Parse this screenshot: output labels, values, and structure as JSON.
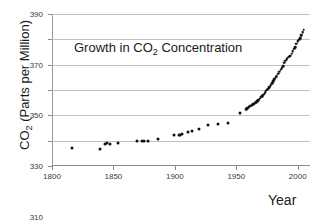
{
  "chart_data": {
    "type": "scatter",
    "title": "Growth in CO2 Concentration",
    "title_prefix": "Growth in CO",
    "title_sub": "2",
    "title_suffix": " Concentration",
    "xlabel": "Year",
    "ylabel": "CO2 (Parts per Million)",
    "ylabel_prefix": "CO",
    "ylabel_sub": "2",
    "ylabel_suffix": " (Parts per Million)",
    "xlim": [
      1800,
      2010
    ],
    "ylim": [
      270,
      390
    ],
    "xticks": [
      1800,
      1850,
      1900,
      1950,
      2000
    ],
    "yticks": [
      270,
      290,
      310,
      330,
      350,
      370,
      390
    ],
    "grid": "horizontal",
    "legend": "none",
    "series": [
      {
        "name": "Ice core records",
        "marker": "filled-circle",
        "color": "#101010",
        "points": [
          [
            1816,
            284.3
          ],
          [
            1839,
            283.4
          ],
          [
            1843,
            287.6
          ],
          [
            1845,
            288.0
          ],
          [
            1847,
            287.2
          ],
          [
            1854,
            288.4
          ],
          [
            1869,
            289.6
          ],
          [
            1873,
            289.6
          ],
          [
            1875,
            289.9
          ],
          [
            1878,
            290.0
          ],
          [
            1886,
            291.4
          ],
          [
            1899,
            294.6
          ],
          [
            1903,
            294.2
          ],
          [
            1904,
            294.4
          ],
          [
            1906,
            295.4
          ],
          [
            1911,
            297.1
          ],
          [
            1914,
            298.0
          ],
          [
            1920,
            299.1
          ],
          [
            1927,
            302.0
          ],
          [
            1935,
            302.8
          ],
          [
            1943,
            304.3
          ],
          [
            1953,
            311.5
          ]
        ]
      },
      {
        "name": "Mauna Loa direct measurements",
        "marker": "filled-circle",
        "color": "#101010",
        "points": [
          [
            1958,
            315.0
          ],
          [
            1959,
            315.6
          ],
          [
            1960,
            316.4
          ],
          [
            1961,
            317.0
          ],
          [
            1962,
            317.6
          ],
          [
            1963,
            318.3
          ],
          [
            1964,
            318.8
          ],
          [
            1965,
            319.4
          ],
          [
            1966,
            320.4
          ],
          [
            1967,
            321.2
          ],
          [
            1968,
            322.0
          ],
          [
            1969,
            323.0
          ],
          [
            1970,
            324.2
          ],
          [
            1971,
            325.2
          ],
          [
            1972,
            326.3
          ],
          [
            1973,
            327.6
          ],
          [
            1974,
            329.2
          ],
          [
            1975,
            330.2
          ],
          [
            1976,
            331.1
          ],
          [
            1977,
            332.0
          ],
          [
            1978,
            333.8
          ],
          [
            1979,
            335.4
          ],
          [
            1980,
            336.8
          ],
          [
            1981,
            338.4
          ],
          [
            1982,
            339.9
          ],
          [
            1983,
            341.1
          ],
          [
            1984,
            342.8
          ],
          [
            1985,
            344.4
          ],
          [
            1986,
            345.9
          ],
          [
            1987,
            347.2
          ],
          [
            1988,
            349.0
          ],
          [
            1989,
            351.5
          ],
          [
            1990,
            353.1
          ],
          [
            1991,
            354.4
          ],
          [
            1992,
            355.6
          ],
          [
            1993,
            356.4
          ],
          [
            1994,
            357.1
          ],
          [
            1995,
            358.8
          ],
          [
            1996,
            360.8
          ],
          [
            1997,
            362.6
          ],
          [
            1998,
            363.8
          ],
          [
            1999,
            366.7
          ],
          [
            2000,
            368.4
          ],
          [
            2001,
            369.6
          ],
          [
            2002,
            371.1
          ],
          [
            2003,
            373.2
          ],
          [
            2004,
            375.8
          ],
          [
            2005,
            377.5
          ]
        ]
      }
    ]
  }
}
